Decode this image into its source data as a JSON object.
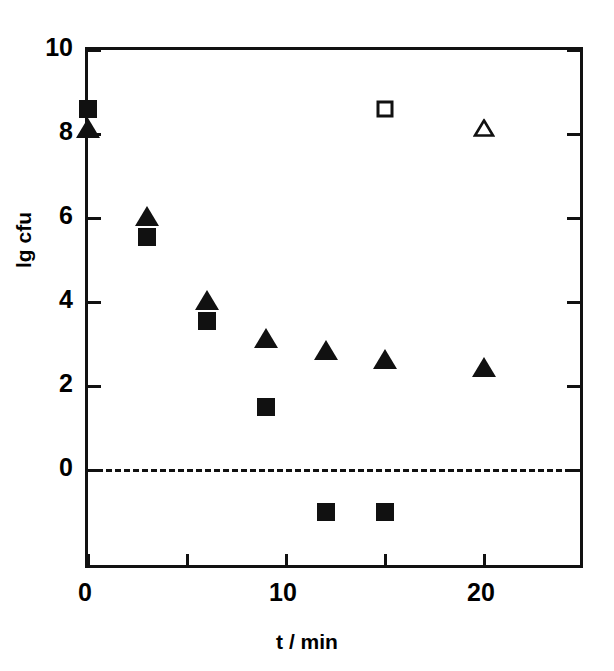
{
  "chart_data": {
    "type": "scatter",
    "title": "",
    "xlabel": "t / min",
    "ylabel": "lg cfu",
    "xlim": [
      0,
      25.15
    ],
    "ylim": [
      -2.4,
      10
    ],
    "grid": false,
    "legend_position": "none",
    "x_ticks_major": [
      0,
      10,
      20
    ],
    "x_ticks_major_labels": [
      "0",
      "10",
      "20"
    ],
    "x_ticks_minor": [
      5,
      15
    ],
    "y_ticks_major": [
      0,
      2,
      4,
      6,
      8,
      10
    ],
    "y_ticks_major_labels": [
      "0",
      "2",
      "4",
      "6",
      "8",
      "10"
    ],
    "reference_lines": [
      {
        "name": "zero-line",
        "axis": "y",
        "value": 0,
        "style": "dashed"
      }
    ],
    "series": [
      {
        "name": "filled-square",
        "marker": "square-filled",
        "color": "#111111",
        "points": [
          {
            "x": 0,
            "y": 8.6
          },
          {
            "x": 3,
            "y": 5.55
          },
          {
            "x": 6,
            "y": 3.55
          },
          {
            "x": 9,
            "y": 1.5
          },
          {
            "x": 12,
            "y": -1.0
          },
          {
            "x": 15,
            "y": -1.0
          }
        ]
      },
      {
        "name": "filled-triangle",
        "marker": "triangle-filled",
        "color": "#111111",
        "points": [
          {
            "x": 0,
            "y": 8.15
          },
          {
            "x": 3,
            "y": 6.05
          },
          {
            "x": 6,
            "y": 4.05
          },
          {
            "x": 9,
            "y": 3.15
          },
          {
            "x": 12,
            "y": 2.85
          },
          {
            "x": 15,
            "y": 2.65
          },
          {
            "x": 20,
            "y": 2.45
          }
        ]
      },
      {
        "name": "open-square",
        "marker": "square-open",
        "color": "#111111",
        "points": [
          {
            "x": 15,
            "y": 8.6
          }
        ]
      },
      {
        "name": "open-triangle",
        "marker": "triangle-open",
        "color": "#111111",
        "points": [
          {
            "x": 20,
            "y": 8.15
          }
        ]
      }
    ]
  }
}
